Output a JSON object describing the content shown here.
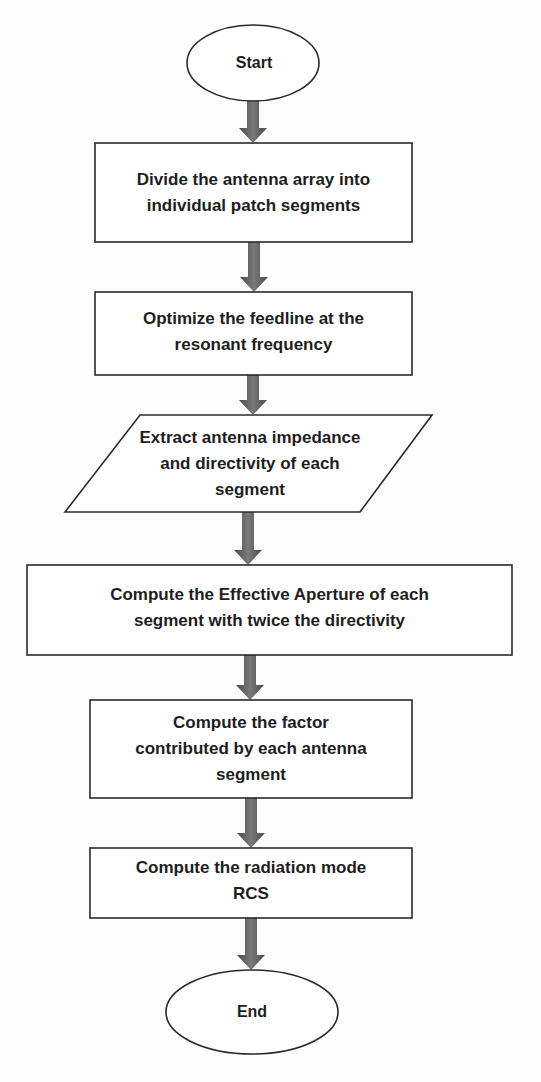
{
  "diagram": {
    "type": "flowchart",
    "colors": {
      "stroke": "#2a2a2a",
      "arrow": "#5a5a5a",
      "fill": "#ffffff",
      "text": "#1e1e1e"
    },
    "nodes": [
      {
        "id": "start",
        "shape": "ellipse",
        "label": "Start"
      },
      {
        "id": "step1",
        "shape": "rectangle",
        "label": "Divide the antenna array into\nindividual patch segments"
      },
      {
        "id": "step2",
        "shape": "rectangle",
        "label": "Optimize the feedline at the\nresonant frequency"
      },
      {
        "id": "step3",
        "shape": "parallelogram",
        "label": "Extract antenna impedance\nand directivity of each\nsegment"
      },
      {
        "id": "step4",
        "shape": "rectangle",
        "label": "Compute the Effective Aperture of each\nsegment with twice the directivity"
      },
      {
        "id": "step5",
        "shape": "rectangle",
        "label": "Compute the factor\ncontributed by each antenna\nsegment"
      },
      {
        "id": "step6",
        "shape": "rectangle",
        "label": "Compute the radiation mode\nRCS"
      },
      {
        "id": "end",
        "shape": "ellipse",
        "label": "End"
      }
    ],
    "edges": [
      {
        "from": "start",
        "to": "step1"
      },
      {
        "from": "step1",
        "to": "step2"
      },
      {
        "from": "step2",
        "to": "step3"
      },
      {
        "from": "step3",
        "to": "step4"
      },
      {
        "from": "step4",
        "to": "step5"
      },
      {
        "from": "step5",
        "to": "step6"
      },
      {
        "from": "step6",
        "to": "end"
      }
    ]
  }
}
